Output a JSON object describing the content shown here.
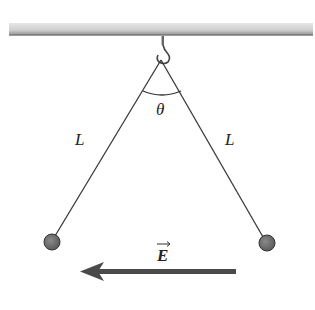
{
  "diagram": {
    "type": "physics-pendulum-electric-field",
    "labels": {
      "left_string": "L",
      "right_string": "L",
      "angle": "θ",
      "field": "E",
      "field_vector_mark": "→"
    },
    "colors": {
      "ceiling_light": "#d4d4d4",
      "ceiling_dark": "#8a8a8a",
      "string": "#3a3a3a",
      "ball": "#6a6a6a",
      "ball_edge": "#333333",
      "arrow": "#4a4a4a"
    },
    "geometry": {
      "pivot": [
        161,
        60
      ],
      "left_ball": [
        52,
        242
      ],
      "right_ball": [
        267,
        243
      ],
      "ball_radius": 8,
      "arrow_from": [
        236,
        272
      ],
      "arrow_to": [
        80,
        272
      ]
    }
  }
}
